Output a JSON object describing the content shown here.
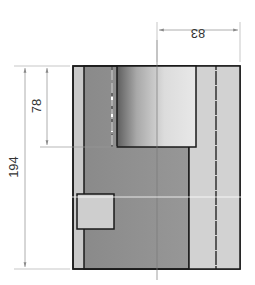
{
  "drawing": {
    "type": "technical-section-view",
    "dimensions": {
      "width_top": "83",
      "height_total": "194",
      "bore_depth": "78"
    },
    "colors": {
      "outline": "#1a1a1a",
      "outer_wall": "#c8c8c8",
      "inner_body": "#8f8f8f",
      "right_wall": "#cfcfcf",
      "bore_gradient_dark": "#6e6e6e",
      "bore_gradient_light": "#e4e4e4",
      "small_square": "#cccccc",
      "dimension_line": "#9a9a9a",
      "centerline": "#7a7a7a",
      "hidden_line": "#ffffff"
    }
  }
}
